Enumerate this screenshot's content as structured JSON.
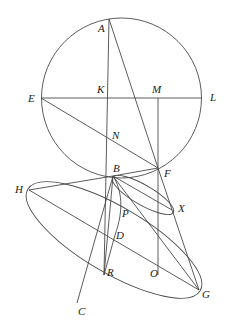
{
  "diagram": {
    "type": "geometric-construction",
    "colors": {
      "stroke": "#4a4a4a",
      "label": "#222222",
      "background": "#ffffff"
    },
    "circle": {
      "cx": 121.5,
      "cy": 98,
      "r": 80
    },
    "points": {
      "A": [
        109,
        19
      ],
      "E": [
        41,
        98
      ],
      "L": [
        202,
        98
      ],
      "K": [
        109,
        98
      ],
      "M": [
        158,
        98
      ],
      "N": [
        109,
        140
      ],
      "F": [
        158,
        168
      ],
      "B": [
        113,
        176
      ],
      "H": [
        29,
        190
      ],
      "X": [
        172,
        210
      ],
      "P": [
        120,
        205
      ],
      "D": [
        115,
        235
      ],
      "R": [
        104,
        275
      ],
      "O": [
        160,
        275
      ],
      "G": [
        199,
        290
      ],
      "C": [
        77,
        303
      ]
    },
    "labels": [
      {
        "name": "A",
        "text": "A",
        "x": 98,
        "y": 32
      },
      {
        "name": "E",
        "text": "E",
        "x": 28,
        "y": 102
      },
      {
        "name": "K",
        "text": "K",
        "x": 97,
        "y": 93
      },
      {
        "name": "M",
        "text": "M",
        "x": 152,
        "y": 93
      },
      {
        "name": "L",
        "text": "L",
        "x": 210,
        "y": 101
      },
      {
        "name": "N",
        "text": "N",
        "x": 112,
        "y": 139
      },
      {
        "name": "B",
        "text": "B",
        "x": 113,
        "y": 172
      },
      {
        "name": "F",
        "text": "F",
        "x": 164,
        "y": 177
      },
      {
        "name": "H",
        "text": "H",
        "x": 15,
        "y": 193
      },
      {
        "name": "X",
        "text": "X",
        "x": 178,
        "y": 212
      },
      {
        "name": "P",
        "text": "P",
        "x": 122,
        "y": 217
      },
      {
        "name": "D",
        "text": "D",
        "x": 116,
        "y": 239
      },
      {
        "name": "R",
        "text": "R",
        "x": 107,
        "y": 276
      },
      {
        "name": "O",
        "text": "O",
        "x": 150,
        "y": 277
      },
      {
        "name": "G",
        "text": "G",
        "x": 202,
        "y": 298
      },
      {
        "name": "C",
        "text": "C",
        "x": 78,
        "y": 315
      }
    ]
  }
}
